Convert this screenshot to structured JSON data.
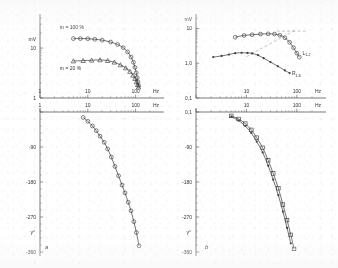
{
  "figure": {
    "panels": [
      {
        "letter": "a",
        "x": 45,
        "y": 249
      },
      {
        "letter": "b",
        "x": 205,
        "y": 249
      }
    ]
  },
  "chart_data": [
    {
      "id": "panel-a-amplitude",
      "type": "line",
      "title": "",
      "xlabel": "Hz",
      "ylabel": "mV",
      "xscale": "log",
      "yscale": "log",
      "xlim": [
        1,
        200
      ],
      "ylim": [
        1,
        40
      ],
      "xticks": [
        1,
        10,
        100
      ],
      "xticklabels": [
        "1",
        "10",
        "100"
      ],
      "yticks": [
        1,
        10
      ],
      "yticklabels": [
        "1",
        "10"
      ],
      "grid": false,
      "annotations": [
        {
          "text": "m = 100 %",
          "x": 2.6,
          "y": 24
        },
        {
          "text": "m = 20 %",
          "x": 2.6,
          "y": 3.6
        }
      ],
      "series": [
        {
          "name": "m = 100 %",
          "marker": "circle",
          "x": [
            5.0,
            7.0,
            10.0,
            14.0,
            20.0,
            30.0,
            42.0,
            55.0,
            68.0,
            80.0,
            90.0,
            97.0,
            103.0,
            108.0,
            112.0,
            116.0
          ],
          "y": [
            15.5,
            15.5,
            15.4,
            15.0,
            14.4,
            13.2,
            11.8,
            10.2,
            8.4,
            6.6,
            5.2,
            4.1,
            3.2,
            2.55,
            2.1,
            1.75
          ]
        },
        {
          "name": "m = 20 %",
          "marker": "triangle",
          "x": [
            5.0,
            8.0,
            12.0,
            18.0,
            26.0,
            36.0,
            48.0,
            62.0,
            76.0,
            88.0,
            97.0,
            104.0,
            110.0,
            115.0
          ],
          "y": [
            5.5,
            5.6,
            5.7,
            5.8,
            5.6,
            5.2,
            4.6,
            4.0,
            3.4,
            2.85,
            2.45,
            2.1,
            1.85,
            1.65
          ]
        }
      ]
    },
    {
      "id": "panel-a-phase",
      "type": "line",
      "title": "",
      "xlabel": "Hz",
      "ylabel": "γ°",
      "xscale": "log",
      "yscale": "linear",
      "xlim": [
        1,
        200
      ],
      "ylim": [
        -360,
        0
      ],
      "xticks": [
        1,
        10,
        100
      ],
      "xticklabels": [
        "1",
        "10",
        "100"
      ],
      "yticks": [
        0,
        -90,
        -180,
        -270,
        -360
      ],
      "yticklabels": [
        "",
        "-90",
        "-180",
        "-270",
        "-360"
      ],
      "grid": false,
      "series": [
        {
          "name": "phase",
          "marker": "circle",
          "x": [
            8.0,
            10.0,
            12.5,
            15.0,
            18.0,
            22.0,
            26.0,
            31.0,
            37.0,
            44.0,
            52.0,
            60.0,
            70.0,
            80.0,
            92.0,
            104.0,
            118.0
          ],
          "y": [
            -14,
            -24,
            -36,
            -48,
            -62,
            -78,
            -95,
            -116,
            -140,
            -164,
            -188,
            -208,
            -232,
            -254,
            -282,
            -310,
            -344
          ]
        }
      ]
    },
    {
      "id": "panel-b-amplitude",
      "type": "line",
      "title": "",
      "xlabel": "Hz",
      "ylabel": "mV",
      "xscale": "log",
      "yscale": "log",
      "xlim": [
        1,
        200
      ],
      "ylim": [
        0.1,
        20
      ],
      "xticks": [
        1,
        10,
        100
      ],
      "xticklabels": [
        "1",
        "10",
        "100"
      ],
      "yticks": [
        0.1,
        1.0,
        10
      ],
      "yticklabels": [
        "0,1",
        "1,0",
        "10"
      ],
      "grid": false,
      "annotations": [
        {
          "text": "L",
          "sub": "1-2",
          "x": 130,
          "y": 1.75
        },
        {
          "text": "R",
          "sub": "1-6",
          "x": 80,
          "y": 0.46
        }
      ],
      "series": [
        {
          "name": "L1-2",
          "marker": "circle",
          "x": [
            6.0,
            9.0,
            13.0,
            19.0,
            27.0,
            36.0,
            46.0,
            58.0,
            72.0,
            86.0,
            100.0,
            112.0
          ],
          "y": [
            5.6,
            6.3,
            6.6,
            6.9,
            7.0,
            6.9,
            6.4,
            5.4,
            4.0,
            2.8,
            1.95,
            1.5
          ]
        },
        {
          "name": "R1-6",
          "marker": "diamond",
          "x": [
            2.2,
            3.2,
            4.5,
            6.0,
            8.0,
            10.5,
            13.0,
            17.0,
            22.0,
            30.0,
            42.0,
            58.0,
            72.0
          ],
          "y": [
            1.5,
            1.62,
            1.78,
            1.95,
            2.0,
            1.98,
            1.92,
            1.7,
            1.4,
            1.08,
            0.82,
            0.62,
            0.52
          ]
        }
      ],
      "asymptotes": [
        {
          "name": "low-slope-asymptote",
          "x1": 10.0,
          "y1": 1.55,
          "x2": 100.0,
          "y2": 9.5
        },
        {
          "name": "high-plateau-asymptote",
          "x1": 40.0,
          "y1": 8.4,
          "x2": 150.0,
          "y2": 8.4
        }
      ]
    },
    {
      "id": "panel-b-phase",
      "type": "line",
      "title": "",
      "xlabel": "Hz",
      "ylabel": "γ°",
      "xscale": "log",
      "yscale": "linear",
      "xlim": [
        1,
        200
      ],
      "ylim": [
        -360,
        0
      ],
      "xticks": [
        1,
        10,
        100
      ],
      "xticklabels": [
        "1",
        "10",
        "100"
      ],
      "yticks": [
        0,
        -90,
        -180,
        -270,
        -360
      ],
      "yticklabels": [
        "0,1",
        "-90",
        "-180",
        "-270",
        "-360"
      ],
      "grid": false,
      "series": [
        {
          "name": "L1-2 phase",
          "marker": "square",
          "x": [
            5.0,
            7.0,
            9.5,
            12.5,
            16.0,
            21.0,
            27.0,
            34.0,
            43.0,
            53.0,
            64.0,
            76.0,
            88.0
          ],
          "y": [
            -10,
            -18,
            -30,
            -46,
            -66,
            -92,
            -124,
            -158,
            -196,
            -238,
            -278,
            -316,
            -352
          ]
        },
        {
          "name": "R1-6 phase",
          "marker": "diamond",
          "x": [
            5.0,
            7.0,
            9.5,
            12.5,
            16.0,
            21.0,
            27.0,
            34.0,
            43.0,
            53.0,
            64.0,
            76.0
          ],
          "y": [
            -12,
            -22,
            -36,
            -54,
            -76,
            -104,
            -138,
            -174,
            -214,
            -256,
            -298,
            -338
          ]
        }
      ]
    }
  ]
}
